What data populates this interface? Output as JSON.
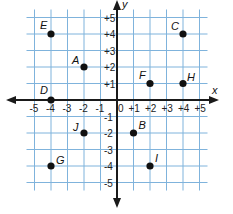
{
  "chart_data": {
    "type": "scatter",
    "title": "",
    "xlabel": "x",
    "ylabel": "y",
    "xlim": [
      -5,
      5
    ],
    "ylim": [
      -5,
      5
    ],
    "grid": true,
    "x_ticks": [
      "-5",
      "-4",
      "-3",
      "-2",
      "-1",
      "0",
      "+1",
      "+2",
      "+3",
      "+4",
      "+5"
    ],
    "y_ticks": [
      "+5",
      "+4",
      "+3",
      "+2",
      "+1",
      "-1",
      "-2",
      "-3",
      "-4",
      "-5"
    ],
    "points": [
      {
        "label": "A",
        "x": -2,
        "y": 2
      },
      {
        "label": "B",
        "x": 1,
        "y": -2
      },
      {
        "label": "C",
        "x": 4,
        "y": 4
      },
      {
        "label": "D",
        "x": -4,
        "y": 0
      },
      {
        "label": "E",
        "x": -4,
        "y": 4
      },
      {
        "label": "F",
        "x": 2,
        "y": 1
      },
      {
        "label": "G",
        "x": -4,
        "y": -4
      },
      {
        "label": "H",
        "x": 4,
        "y": 1
      },
      {
        "label": "I",
        "x": 2,
        "y": -4
      },
      {
        "label": "J",
        "x": -2,
        "y": -2
      }
    ]
  },
  "colors": {
    "grid": "#7fb3dc",
    "axis": "#1a1a1a",
    "point": "#111111"
  }
}
